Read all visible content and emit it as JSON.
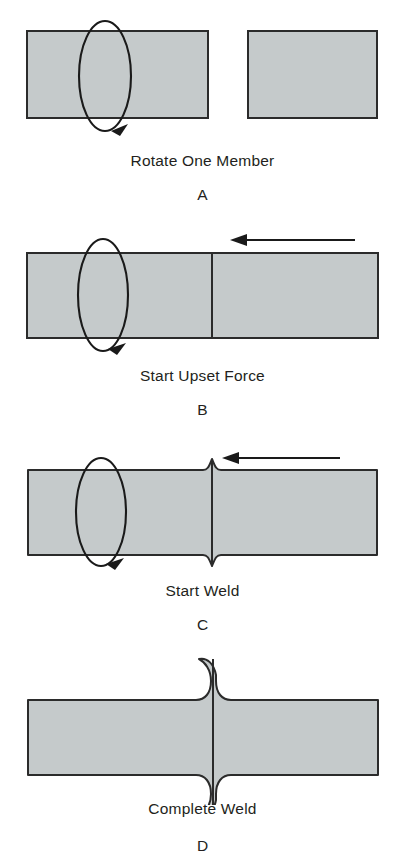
{
  "figure": {
    "background_color": "#ffffff",
    "metal_fill_color": "#c5cacb",
    "outline_color": "#2b2b2b",
    "text_color": "#231f20"
  },
  "panels": [
    {
      "letter": "A",
      "caption": "Rotate One Member",
      "description": "Two separate bar members, left one rotating",
      "has_rotation_arrow": true,
      "has_force_arrow": false,
      "flash": "none",
      "members": 2
    },
    {
      "letter": "B",
      "caption": "Start Upset Force",
      "description": "Members brought into contact, axial force applied",
      "has_rotation_arrow": true,
      "has_force_arrow": true,
      "flash": "none",
      "members": 1
    },
    {
      "letter": "C",
      "caption": "Start Weld",
      "description": "Friction heating begins, small flash forms at interface",
      "has_rotation_arrow": true,
      "has_force_arrow": true,
      "flash": "small",
      "members": 1
    },
    {
      "letter": "D",
      "caption": "Complete Weld",
      "description": "Weld complete with full upset flash at joint",
      "has_rotation_arrow": false,
      "has_force_arrow": false,
      "flash": "large",
      "members": 1
    }
  ]
}
